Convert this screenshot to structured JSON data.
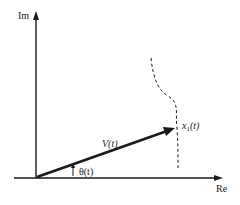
{
  "diagram": {
    "type": "phasor-diagram",
    "colors": {
      "background": "#ffffff",
      "ink": "#1a1a1a"
    },
    "axes": {
      "vertical_label": "Im",
      "horizontal_label": "Re"
    },
    "vector": {
      "label": "V(t)",
      "tip_label_main": "x",
      "tip_label_sub": "1",
      "tip_label_arg": "(t)"
    },
    "angle": {
      "label": "θ(t)"
    },
    "trajectory": {
      "style": "dashed"
    }
  }
}
